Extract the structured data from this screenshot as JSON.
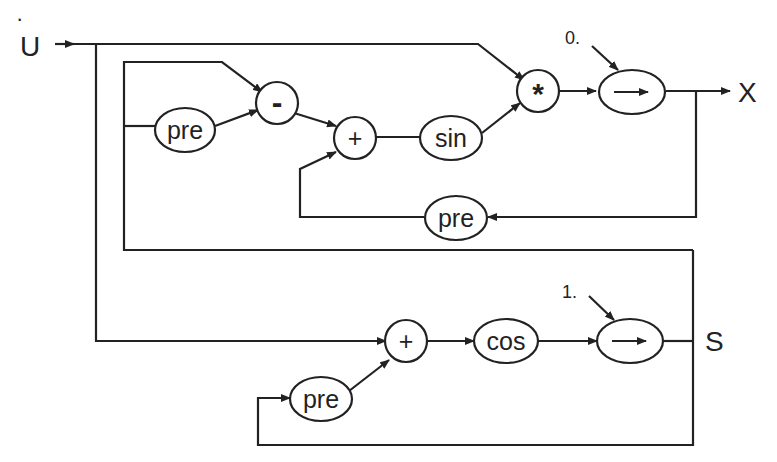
{
  "diagram": {
    "input": {
      "label": "U",
      "dot": "·"
    },
    "outputs": {
      "x": "X",
      "s": "S"
    },
    "init_values": {
      "top": "0.",
      "bottom": "1."
    },
    "nodes": {
      "pre_top_left": "pre",
      "minus": "-",
      "plus_top": "+",
      "sin": "sin",
      "mult": "*",
      "follow_top": "→",
      "pre_feedback": "pre",
      "plus_bottom": "+",
      "cos": "cos",
      "follow_bottom": "→",
      "pre_bottom": "pre"
    },
    "stroke_color": "#222222"
  }
}
